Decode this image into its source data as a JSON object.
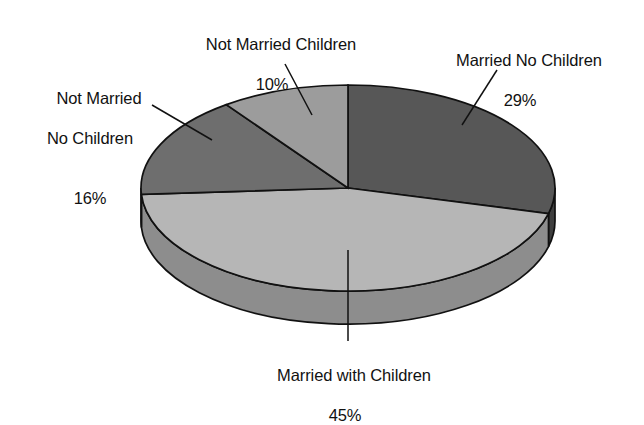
{
  "chart_data": {
    "type": "pie",
    "title": "",
    "subtitle": "",
    "xlabel": "",
    "ylabel": "",
    "legend_position": "none",
    "grid": false,
    "three_d": true,
    "start_angle_deg": 0,
    "direction": "clockwise",
    "units": "percent",
    "categories": [
      "Married No Children",
      "Married with Children",
      "Not Married No Children",
      "Not Married Children"
    ],
    "values": [
      29,
      45,
      16,
      10
    ],
    "slices": [
      {
        "label": "Married No Children",
        "value": 29,
        "value_text": "29%",
        "color": "#575757",
        "side_color": "#3f3f3f"
      },
      {
        "label": "Married with Children",
        "value": 45,
        "value_text": "45%",
        "color": "#b6b6b6",
        "side_color": "#8d8d8d"
      },
      {
        "label": "Not Married No Children",
        "value": 16,
        "value_text": "16%",
        "color": "#6e6e6e",
        "side_color": "#565656"
      },
      {
        "label": "Not Married Children",
        "value": 10,
        "value_text": "9c9c9c-slice",
        "color": "#9c9c9c",
        "side_color": "#7a7a7a"
      }
    ]
  },
  "labels": {
    "not_married_children": {
      "line1": "Not Married Children",
      "percent": "10%"
    },
    "married_no_children": {
      "line1": "Married No Children",
      "percent": "29%"
    },
    "not_married_no_children": {
      "line1": "Not Married",
      "line2": "No Children",
      "percent": "16%"
    },
    "married_with_children": {
      "line1": "Married with Children",
      "percent": "45%"
    }
  },
  "style": {
    "background": "#ffffff",
    "outline": "#111111",
    "text": "#111111"
  }
}
